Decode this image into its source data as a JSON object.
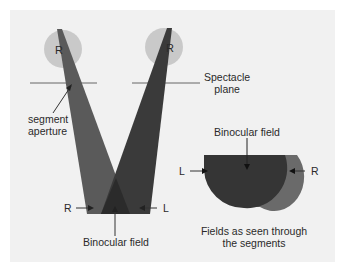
{
  "diagram": {
    "left_eye": {
      "label": "R"
    },
    "right_eye": {
      "label": "R"
    },
    "labels": {
      "segment_aperture": [
        "segment",
        "aperture"
      ],
      "spectacle_plane": [
        "Spectacle",
        "plane"
      ],
      "beam_R": "R",
      "beam_L": "L",
      "binocular_field_bottom": "Binocular field",
      "binocular_field_right": "Binocular field",
      "field_L": "L",
      "field_R": "R",
      "fields_caption": [
        "Fields as seen through",
        "the segments"
      ]
    },
    "colors": {
      "eye_fill": "#c9c9c9",
      "left_beam": "#5a5a5a",
      "right_beam": "#3a3a3a",
      "overlap": "#2e2e2e",
      "right_field": "#6a6a6a",
      "left_field": "#353535",
      "line": "#555555"
    }
  }
}
